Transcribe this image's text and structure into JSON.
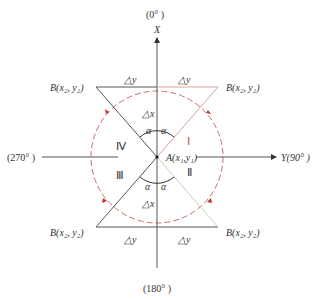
{
  "axes": {
    "x_axis_label": "X",
    "x_top_label": "(0°  )",
    "x_bottom_label": "(180°  )",
    "y_axis_label": "Y(90°  )",
    "y_left_label": "(270°  )"
  },
  "center_point": {
    "label": "A(x₁,y₁)"
  },
  "point_labels": {
    "top_left": "B(x₂, y₂)",
    "top_right": "B(x₂, y₂)",
    "bottom_left": "B(x₂, y₂)",
    "bottom_right": "B(x₂, y₂)"
  },
  "delta_labels": {
    "dy_top_left": "△y",
    "dy_top_right": "△y",
    "dy_bottom_left": "△y",
    "dy_bottom_right": "△y",
    "dx_top": "△x",
    "dx_bottom": "△x"
  },
  "angle_labels": {
    "top_left": "α",
    "top_right": "α",
    "bottom_left": "α",
    "bottom_right": "α"
  },
  "quadrants": [
    {
      "id": "I",
      "label": "Ⅰ",
      "color": "#d9a0a0"
    },
    {
      "id": "II",
      "label": "Ⅱ",
      "color": "#b8dcb0"
    },
    {
      "id": "III",
      "label": "Ⅲ",
      "color": "#555555"
    },
    {
      "id": "IV",
      "label": "Ⅳ",
      "color": "#555555"
    }
  ],
  "colors": {
    "axis": "#555555",
    "circle": "#c0504d",
    "arrow": "#c0302d",
    "quadrant_I_line": "#d9a0a0",
    "quadrant_II_line": "#b8dcb0",
    "top_right_bar": "#e0b0b0"
  }
}
